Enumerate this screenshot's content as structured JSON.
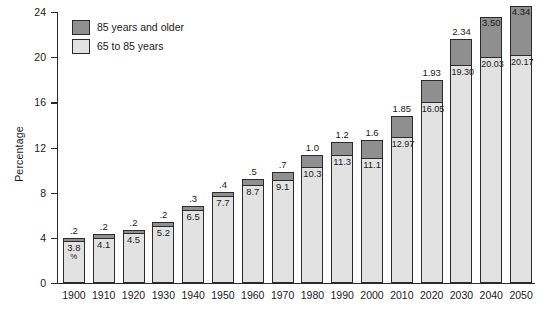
{
  "chart_data": {
    "type": "bar",
    "subtype": "stacked-bar",
    "title": "",
    "xlabel": "",
    "ylabel": "Percentage",
    "ylim": [
      0,
      24
    ],
    "yticks": [
      0,
      4,
      8,
      12,
      16,
      20,
      24
    ],
    "grid": false,
    "legend_position": "top-left",
    "unit_note": "%",
    "categories": [
      "1900",
      "1910",
      "1920",
      "1930",
      "1940",
      "1950",
      "1960",
      "1970",
      "1980",
      "1990",
      "2000",
      "2010",
      "2020",
      "2030",
      "2040",
      "2050"
    ],
    "series": [
      {
        "name": "65 to 85 years",
        "color": "#e2e2e2",
        "values": [
          3.8,
          4.1,
          4.5,
          5.2,
          6.5,
          7.7,
          8.7,
          9.1,
          10.3,
          11.3,
          11.1,
          12.97,
          16.05,
          19.3,
          20.03,
          20.17
        ],
        "labels": [
          "3.8",
          "4.1",
          "4.5",
          "5.2",
          "6.5",
          "7.7",
          "8.7",
          "9.1",
          "10.3",
          "11.3",
          "11.1",
          "12.97",
          "16.05",
          "19.30",
          "20.03",
          "20.17"
        ]
      },
      {
        "name": "85 years and older",
        "color": "#8f8f8f",
        "values": [
          0.2,
          0.2,
          0.2,
          0.2,
          0.3,
          0.4,
          0.5,
          0.7,
          1.0,
          1.2,
          1.6,
          1.85,
          1.93,
          2.34,
          3.5,
          4.34
        ],
        "labels": [
          ".2",
          ".2",
          ".2",
          ".2",
          ".3",
          ".4",
          ".5",
          ".7",
          "1.0",
          "1.2",
          "1.6",
          "1.85",
          "1.93",
          "2.34",
          "3.50",
          "4.34"
        ]
      }
    ],
    "totals": [
      4.0,
      4.3,
      4.7,
      5.4,
      6.8,
      8.1,
      9.2,
      9.8,
      11.3,
      12.5,
      12.7,
      14.82,
      17.98,
      21.64,
      23.53,
      24.51
    ]
  },
  "legend": {
    "items": [
      {
        "label": "85 years and older",
        "color": "#8f8f8f"
      },
      {
        "label": "65 to 85 years",
        "color": "#e2e2e2"
      }
    ]
  },
  "axis": {
    "y_title": "Percentage",
    "y_ticks": [
      "24",
      "20",
      "16",
      "12",
      "8",
      "4",
      "0"
    ],
    "x_ticks": [
      "1900",
      "1910",
      "1920",
      "1930",
      "1940",
      "1950",
      "1960",
      "1970",
      "1980",
      "1990",
      "2000",
      "2010",
      "2020",
      "2030",
      "2040",
      "2050"
    ]
  },
  "annotations": {
    "percent_symbol": "%"
  }
}
